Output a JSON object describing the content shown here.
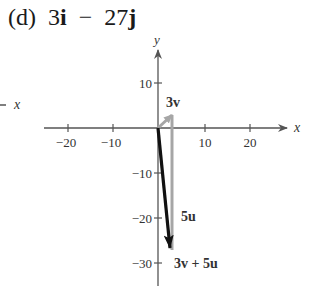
{
  "title": {
    "part": "(d)",
    "expression_a": "3",
    "unit_i": "i",
    "operator": "−",
    "expression_b": "27",
    "unit_j": "j"
  },
  "axes": {
    "x_label": "x",
    "y_label": "y",
    "x_ticks": [
      "−20",
      "−10",
      "10",
      "20"
    ],
    "y_ticks": [
      "10",
      "−10",
      "−20",
      "−30"
    ],
    "stray_axis_label": "x"
  },
  "vectors": {
    "v3_label": "3v",
    "u5_label": "5u",
    "sum_label": "3v + 5u"
  },
  "colors": {
    "axis": "#555555",
    "gray_vector": "#a6a6a6",
    "resultant": "#111111"
  }
}
